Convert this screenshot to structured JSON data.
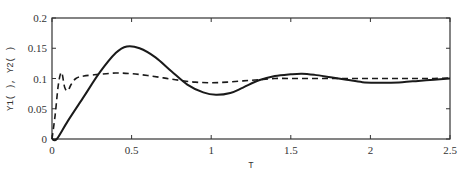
{
  "chart_data": {
    "type": "line",
    "title": "",
    "xlabel": "T",
    "ylabel": "Y1(   ), Y2(   )",
    "xlim": [
      0,
      2.5
    ],
    "ylim": [
      0,
      0.2
    ],
    "grid": false,
    "legend": null,
    "x_ticks": [
      0,
      0.5,
      1,
      1.5,
      2,
      2.5
    ],
    "x_tick_labels": [
      "0",
      "0.5",
      "1",
      "1.5",
      "2",
      "2.5"
    ],
    "y_ticks": [
      0,
      0.05,
      0.1,
      0.15,
      0.2
    ],
    "y_tick_labels": [
      "0",
      "0.05",
      "0.1",
      "0.15",
      "0.2"
    ],
    "series": [
      {
        "name": "Y1",
        "style": "solid",
        "color": "#1a1a1a",
        "x": [
          0.0,
          0.03,
          0.1,
          0.2,
          0.3,
          0.4,
          0.47,
          0.55,
          0.65,
          0.75,
          0.85,
          0.95,
          1.03,
          1.12,
          1.2,
          1.3,
          1.4,
          1.5,
          1.57,
          1.65,
          1.75,
          1.85,
          1.95,
          2.05,
          2.1,
          2.2,
          2.3,
          2.4,
          2.5
        ],
        "y": [
          0.0,
          0.0,
          0.03,
          0.07,
          0.11,
          0.142,
          0.153,
          0.15,
          0.135,
          0.112,
          0.09,
          0.077,
          0.073,
          0.076,
          0.085,
          0.097,
          0.104,
          0.107,
          0.108,
          0.106,
          0.102,
          0.098,
          0.094,
          0.093,
          0.093,
          0.094,
          0.096,
          0.098,
          0.1
        ]
      },
      {
        "name": "Y2",
        "style": "dashed",
        "color": "#1a1a1a",
        "x": [
          0.0,
          0.02,
          0.04,
          0.06,
          0.08,
          0.1,
          0.12,
          0.15,
          0.2,
          0.3,
          0.4,
          0.5,
          0.6,
          0.7,
          0.8,
          0.9,
          1.0,
          1.1,
          1.2,
          1.3,
          1.4,
          1.5,
          1.6,
          1.7,
          1.8,
          1.9,
          2.0,
          2.1,
          2.2,
          2.3,
          2.4,
          2.5
        ],
        "y": [
          0.0,
          0.04,
          0.09,
          0.11,
          0.085,
          0.08,
          0.09,
          0.1,
          0.104,
          0.107,
          0.109,
          0.108,
          0.105,
          0.101,
          0.097,
          0.094,
          0.093,
          0.094,
          0.096,
          0.098,
          0.1,
          0.1,
          0.1,
          0.1,
          0.1,
          0.1,
          0.1,
          0.1,
          0.1,
          0.1,
          0.1,
          0.101
        ]
      }
    ]
  },
  "layout": {
    "plot_left": 52,
    "plot_right": 450,
    "plot_top": 18,
    "plot_bottom": 139
  }
}
